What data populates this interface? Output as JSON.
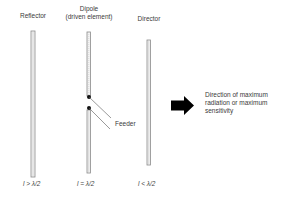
{
  "elements": [
    {
      "name": "Reflector",
      "label": "Reflector",
      "condition": "l > λ/2"
    },
    {
      "name": "Dipole",
      "label_line1": "Dipole",
      "label_line2": "(driven element)",
      "condition": "l = λ/2"
    },
    {
      "name": "Director",
      "label": "Director",
      "condition": "l < λ/2"
    }
  ],
  "feeder_label": "Feeder",
  "direction": {
    "line1": "Direction of maximum",
    "line2": "radiation or maximum",
    "line3": "sensitivity"
  },
  "colors": {
    "rod_stroke": "#8a8a8a",
    "rod_fill": "#f2f2f2",
    "arrow": "#000000",
    "text": "#3a3a3a"
  }
}
